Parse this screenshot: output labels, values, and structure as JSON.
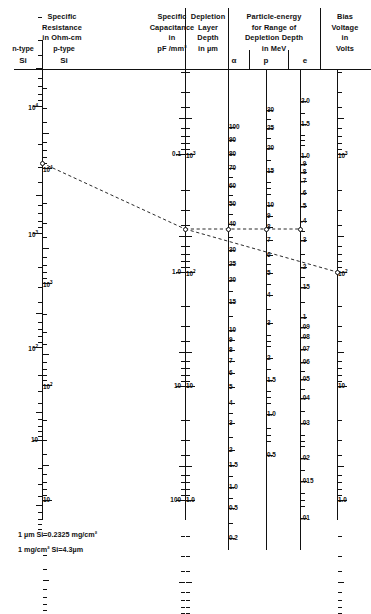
{
  "figure": {
    "footnotes": [
      "1 µm Si=0.2325 mg/cm²",
      "1 mg/cm² Si=4.3µm"
    ]
  },
  "columns": {
    "resistance": {
      "header": [
        "Specific",
        "Resistance",
        "in Ohm-cm"
      ],
      "sub_left": "n-type",
      "sub_right": "p-type",
      "sub_left2": "Si",
      "sub_right2": "Si"
    },
    "capacitance": {
      "header": [
        "Specific",
        "Capacitance",
        "in",
        "pF /mm²"
      ]
    },
    "depletion": {
      "header": [
        "Depletion",
        "Layer",
        "Depth",
        "in µm"
      ]
    },
    "particle": {
      "header": [
        "Particle-energy",
        "for Range of",
        "Depletion Depth",
        "in MeV"
      ],
      "sub": [
        "α",
        "p",
        "e"
      ]
    },
    "bias": {
      "header": [
        "Bias",
        "Voltage",
        "in",
        "Volts"
      ]
    }
  },
  "chart_data": {
    "type": "nomogram",
    "axes": [
      {
        "name": "n-type Si specific resistance",
        "unit": "Ohm-cm",
        "label_side": "left",
        "direction": "decreasing-downward",
        "labeled_ticks": [
          "10⁴",
          "10³",
          "10²",
          "10"
        ]
      },
      {
        "name": "p-type Si specific resistance",
        "unit": "Ohm-cm",
        "label_side": "right",
        "direction": "decreasing-downward",
        "labeled_ticks": [
          "10⁴",
          "10³",
          "10²",
          "10"
        ]
      },
      {
        "name": "Specific capacitance",
        "unit": "pF/mm²",
        "label_side": "left",
        "direction": "increasing-downward",
        "labeled_ticks": [
          "0.1",
          "1.0",
          "10",
          "100"
        ]
      },
      {
        "name": "Depletion layer depth",
        "unit": "µm",
        "label_side": "right",
        "direction": "decreasing-downward",
        "labeled_ticks": [
          "10³",
          "10²",
          "10",
          "1.0"
        ]
      },
      {
        "name": "Alpha particle energy",
        "unit": "MeV",
        "label_side": "right",
        "direction": "decreasing-downward",
        "labeled_ticks": [
          "100",
          "90",
          "80",
          "70",
          "60",
          "50",
          "40",
          "30",
          "25",
          "20",
          "15",
          "10",
          "9",
          "8",
          "7",
          "6",
          "5",
          "4",
          "3",
          "2",
          "1.5",
          "1.0",
          "0.5",
          "0.2"
        ]
      },
      {
        "name": "Proton energy",
        "unit": "MeV",
        "label_side": "right",
        "direction": "decreasing-downward",
        "labeled_ticks": [
          "30",
          "25",
          "20",
          "15",
          "10",
          "9",
          "8",
          "7",
          "6",
          "5",
          "4",
          "3",
          "2",
          "1.5",
          "1.0",
          "0.5"
        ]
      },
      {
        "name": "Electron energy",
        "unit": "MeV",
        "label_side": "right",
        "direction": "decreasing-downward",
        "labeled_ticks": [
          "2.0",
          "1.5",
          "1.0",
          ".9",
          ".8",
          ".7",
          ".6",
          ".5",
          ".4",
          ".3",
          ".2",
          ".15",
          ".1",
          ".09",
          ".08",
          ".07",
          ".06",
          ".05",
          ".04",
          ".03",
          ".02",
          ".015",
          ".01"
        ]
      },
      {
        "name": "Bias voltage",
        "unit": "Volts",
        "label_side": "right",
        "direction": "decreasing-downward",
        "labeled_ticks": [
          "10³",
          "10²",
          "10",
          "1.0"
        ]
      }
    ],
    "isopleth": {
      "style": "dashed",
      "description": "Worked example line: from ~10⁴ Ohm-cm n-type Si through the capacitance/depletion pivot to α=25 MeV, p=6 MeV, e≈.3 MeV, and down to ~40 Volts bias.",
      "markers": [
        {
          "axis": "n-type Si specific resistance",
          "value": "10⁴"
        },
        {
          "axis": "Specific capacitance",
          "value": "~0.35"
        },
        {
          "axis": "Alpha particle energy",
          "value": "25"
        },
        {
          "axis": "Proton energy",
          "value": "6"
        },
        {
          "axis": "Electron energy",
          "value": "~.3"
        },
        {
          "axis": "Bias voltage",
          "value": "~40"
        }
      ]
    }
  },
  "ticks": {
    "res_n": [
      {
        "y": 106,
        "label": "10⁴",
        "major": true
      },
      {
        "y": 233,
        "label": "10³",
        "major": true
      },
      {
        "y": 347,
        "label": "10²",
        "major": true
      },
      {
        "y": 440,
        "label": "10",
        "major": true
      }
    ],
    "res_p": [
      {
        "y": 168,
        "label": "10⁴",
        "major": true
      },
      {
        "y": 283,
        "label": "10³",
        "major": true
      },
      {
        "y": 385,
        "label": "10²",
        "major": true
      },
      {
        "y": 500,
        "label": "10",
        "major": true
      }
    ],
    "cap_left": [
      {
        "y": 154,
        "label": "0.1"
      },
      {
        "y": 272,
        "label": "1.0"
      },
      {
        "y": 386,
        "label": "10"
      },
      {
        "y": 500,
        "label": "100"
      }
    ],
    "dep_right": [
      {
        "y": 154,
        "label": "10³"
      },
      {
        "y": 272,
        "label": "10²"
      },
      {
        "y": 386,
        "label": "10"
      },
      {
        "y": 500,
        "label": "1.0"
      }
    ],
    "alpha": [
      {
        "y": 127,
        "label": "100"
      },
      {
        "y": 140,
        "label": "90"
      },
      {
        "y": 154,
        "label": "80"
      },
      {
        "y": 168,
        "label": "70"
      },
      {
        "y": 186,
        "label": "60"
      },
      {
        "y": 204,
        "label": "50"
      },
      {
        "y": 224,
        "label": "40"
      },
      {
        "y": 250,
        "label": "30"
      },
      {
        "y": 264,
        "label": "25"
      },
      {
        "y": 280,
        "label": "20"
      },
      {
        "y": 302,
        "label": "15"
      },
      {
        "y": 330,
        "label": "10"
      },
      {
        "y": 340,
        "label": "9"
      },
      {
        "y": 350,
        "label": "8"
      },
      {
        "y": 361,
        "label": "7"
      },
      {
        "y": 373,
        "label": "6"
      },
      {
        "y": 387,
        "label": "5"
      },
      {
        "y": 403,
        "label": "4"
      },
      {
        "y": 423,
        "label": "3"
      },
      {
        "y": 450,
        "label": "2"
      },
      {
        "y": 465,
        "label": "1.5"
      },
      {
        "y": 487,
        "label": "1.0"
      },
      {
        "y": 508,
        "label": "0.5"
      },
      {
        "y": 538,
        "label": "0.2"
      }
    ],
    "proton": [
      {
        "y": 110,
        "label": "30"
      },
      {
        "y": 128,
        "label": "25"
      },
      {
        "y": 148,
        "label": "20"
      },
      {
        "y": 171,
        "label": "15"
      },
      {
        "y": 205,
        "label": "10"
      },
      {
        "y": 216,
        "label": "9"
      },
      {
        "y": 227,
        "label": "8"
      },
      {
        "y": 240,
        "label": "7"
      },
      {
        "y": 255,
        "label": "6"
      },
      {
        "y": 273,
        "label": "5"
      },
      {
        "y": 295,
        "label": "4"
      },
      {
        "y": 323,
        "label": "3"
      },
      {
        "y": 358,
        "label": "2"
      },
      {
        "y": 380,
        "label": "1.5"
      },
      {
        "y": 414,
        "label": "1.0"
      },
      {
        "y": 455,
        "label": "0.5"
      }
    ],
    "electron": [
      {
        "y": 101,
        "label": "2.0"
      },
      {
        "y": 124,
        "label": "1.5"
      },
      {
        "y": 156,
        "label": "1.0"
      },
      {
        "y": 164,
        "label": ".9"
      },
      {
        "y": 172,
        "label": ".8"
      },
      {
        "y": 181,
        "label": ".7"
      },
      {
        "y": 193,
        "label": ".6"
      },
      {
        "y": 206,
        "label": ".5"
      },
      {
        "y": 221,
        "label": ".4"
      },
      {
        "y": 240,
        "label": ".3"
      },
      {
        "y": 267,
        "label": ".2"
      },
      {
        "y": 287,
        "label": ".15"
      },
      {
        "y": 317,
        "label": ".1"
      },
      {
        "y": 327,
        "label": ".09"
      },
      {
        "y": 337,
        "label": ".08"
      },
      {
        "y": 349,
        "label": ".07"
      },
      {
        "y": 362,
        "label": ".06"
      },
      {
        "y": 379,
        "label": ".05"
      },
      {
        "y": 398,
        "label": ".04"
      },
      {
        "y": 423,
        "label": ".03"
      },
      {
        "y": 458,
        "label": ".02"
      },
      {
        "y": 481,
        "label": ".015"
      },
      {
        "y": 518,
        "label": ".01"
      }
    ],
    "bias": [
      {
        "y": 154,
        "label": "10³"
      },
      {
        "y": 272,
        "label": "10²"
      },
      {
        "y": 386,
        "label": "10"
      },
      {
        "y": 500,
        "label": "1.0"
      }
    ]
  }
}
